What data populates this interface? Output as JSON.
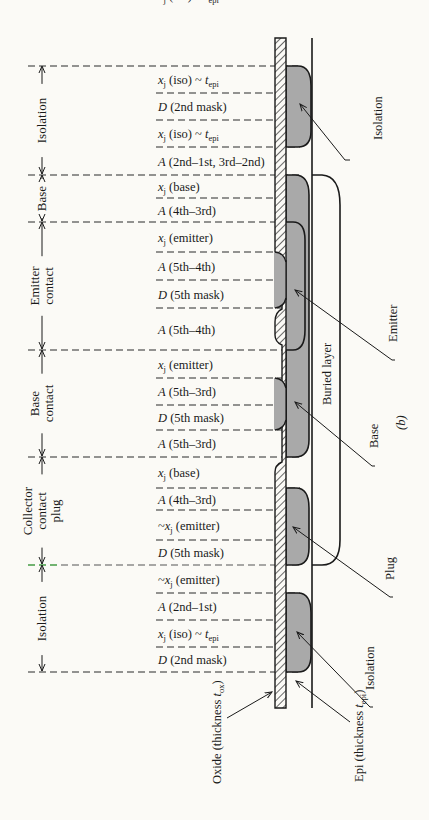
{
  "figure_label": "(b)",
  "sections": [
    {
      "name": "Isolation",
      "lines": [
        "Isolation"
      ]
    },
    {
      "name": "Base",
      "lines": [
        "Base"
      ]
    },
    {
      "name": "Emitter contact",
      "lines": [
        "Emitter",
        "contact"
      ]
    },
    {
      "name": "Base contact",
      "lines": [
        "Base",
        "contact"
      ]
    },
    {
      "name": "Collector contact plug",
      "lines": [
        "Collector",
        "contact",
        "plug"
      ]
    },
    {
      "name": "Isolation",
      "lines": [
        "Isolation"
      ]
    }
  ],
  "rows": [
    {
      "pre": "",
      "sym": "x",
      "symsub": "j",
      "rest": " (iso) ~ ",
      "t": "t",
      "tsub": "epi"
    },
    {
      "pre": "",
      "sym": "D",
      "symsub": "",
      "rest": " (2nd mask)",
      "t": "",
      "tsub": ""
    },
    {
      "pre": "",
      "sym": "x",
      "symsub": "j",
      "rest": " (iso) ~ ",
      "t": "t",
      "tsub": "epi"
    },
    {
      "pre": "",
      "sym": "A",
      "symsub": "",
      "rest": " (2nd–1st, 3rd–2nd)",
      "t": "",
      "tsub": ""
    },
    {
      "pre": "",
      "sym": "x",
      "symsub": "j",
      "rest": " (base)",
      "t": "",
      "tsub": ""
    },
    {
      "pre": "",
      "sym": "A",
      "symsub": "",
      "rest": " (4th–3rd)",
      "t": "",
      "tsub": ""
    },
    {
      "pre": "",
      "sym": "x",
      "symsub": "j",
      "rest": " (emitter)",
      "t": "",
      "tsub": ""
    },
    {
      "pre": "",
      "sym": "A",
      "symsub": "",
      "rest": " (5th–4th)",
      "t": "",
      "tsub": ""
    },
    {
      "pre": "",
      "sym": "D",
      "symsub": "",
      "rest": " (5th mask)",
      "t": "",
      "tsub": ""
    },
    {
      "pre": "",
      "sym": "A",
      "symsub": "",
      "rest": " (5th–4th)",
      "t": "",
      "tsub": ""
    },
    {
      "pre": "",
      "sym": "x",
      "symsub": "j",
      "rest": " (emitter)",
      "t": "",
      "tsub": ""
    },
    {
      "pre": "",
      "sym": "A",
      "symsub": "",
      "rest": " (5th–3rd)",
      "t": "",
      "tsub": ""
    },
    {
      "pre": "",
      "sym": "D",
      "symsub": "",
      "rest": " (5th mask)",
      "t": "",
      "tsub": ""
    },
    {
      "pre": "",
      "sym": "A",
      "symsub": "",
      "rest": " (5th–3rd)",
      "t": "",
      "tsub": ""
    },
    {
      "pre": "",
      "sym": "x",
      "symsub": "j",
      "rest": " (base)",
      "t": "",
      "tsub": ""
    },
    {
      "pre": "",
      "sym": "A",
      "symsub": "",
      "rest": " (4th–3rd)",
      "t": "",
      "tsub": ""
    },
    {
      "pre": "~",
      "sym": "x",
      "symsub": "j",
      "rest": " (emitter)",
      "t": "",
      "tsub": ""
    },
    {
      "pre": "",
      "sym": "D",
      "symsub": "",
      "rest": " (5th mask)",
      "t": "",
      "tsub": ""
    },
    {
      "pre": "~",
      "sym": "x",
      "symsub": "j",
      "rest": " (emitter)",
      "t": "",
      "tsub": ""
    },
    {
      "pre": "",
      "sym": "A",
      "symsub": "",
      "rest": " (2nd–1st)",
      "t": "",
      "tsub": ""
    },
    {
      "pre": "",
      "sym": "x",
      "symsub": "j",
      "rest": " (iso) ~ ",
      "t": "t",
      "tsub": "epi"
    },
    {
      "pre": "",
      "sym": "D",
      "symsub": "",
      "rest": " (2nd mask)",
      "t": "",
      "tsub": ""
    },
    {
      "pre": "",
      "sym": "x",
      "symsub": "j",
      "rest": " (iso) ~ ",
      "t": "t",
      "tsub": "epi"
    }
  ],
  "callouts": {
    "isolation_top": "Isolation",
    "emitter": "Emitter",
    "buried_layer": "Buried layer",
    "base": "Base",
    "plug": "Plug",
    "isolation_bottom": "Isolation",
    "oxide_prefix": "Oxide (thickness ",
    "oxide_t": "t",
    "oxide_sub": "ox",
    "oxide_suffix": ")",
    "epi_prefix": "Epi (thickness ",
    "epi_t": "t",
    "epi_sub": "epi",
    "epi_suffix": ")"
  },
  "colors": {
    "ink": "#1a1a1a",
    "diffusion_fill": "#a9a9a9",
    "paper": "#fbfaf6",
    "highlight_line": "#3fbf3f"
  }
}
